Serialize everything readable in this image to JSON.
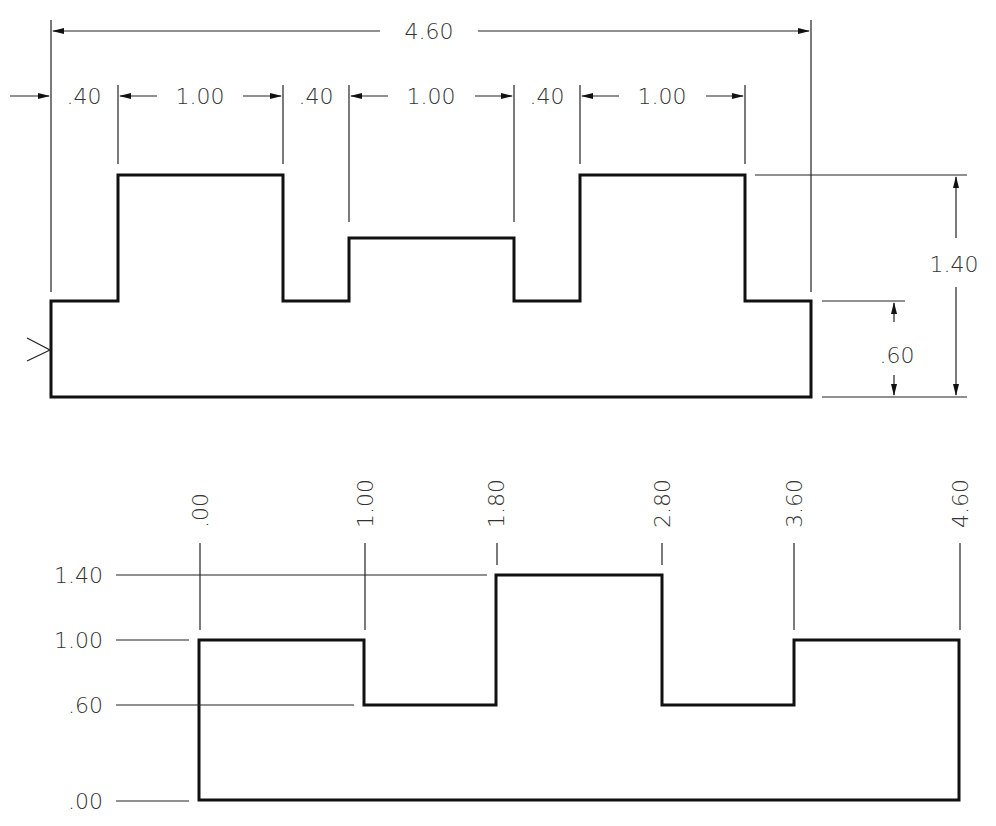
{
  "top_view": {
    "overall_width": "4.60",
    "chain_dims": [
      ".40",
      "1.00",
      ".40",
      "1.00",
      ".40",
      "1.00"
    ],
    "height_total": "1.40",
    "height_base": ".60"
  },
  "bottom_view": {
    "x_ordinates": [
      ".00",
      "1.00",
      "1.80",
      "2.80",
      "3.60",
      "4.60"
    ],
    "y_ordinates": [
      "1.40",
      "1.00",
      ".60",
      ".00"
    ]
  },
  "colors": {
    "line": "#111111",
    "text": "#333333",
    "background": "#ffffff"
  }
}
